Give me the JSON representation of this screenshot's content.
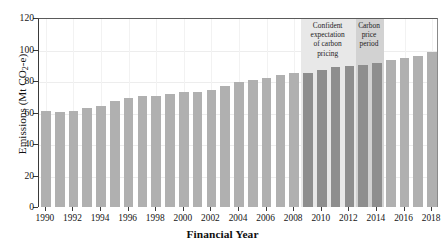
{
  "figure": {
    "ghost_text": "",
    "background_color": "#ffffff"
  },
  "axes": {
    "y_title_main": "Emissions (Mt CO",
    "y_title_sub": "2",
    "y_title_tail": "-e)",
    "x_title": "Financial Year",
    "y_ticks": [
      "0",
      "20",
      "40",
      "60",
      "80",
      "100",
      "120"
    ],
    "x_ticks": [
      "1990",
      "1992",
      "1994",
      "1996",
      "1998",
      "2000",
      "2002",
      "2004",
      "2006",
      "2008",
      "2010",
      "2012",
      "2014",
      "2016",
      "2018"
    ]
  },
  "annotations": {
    "confident": {
      "label": "Confident expectation of carbon pricing",
      "line1": "Confident",
      "line2": "expectation",
      "line3": "of carbon",
      "line4": "pricing",
      "start_year": 2009,
      "end_year": 2013,
      "fill": "#e8e8e8"
    },
    "carbon_price": {
      "label": "Carbon price period",
      "line1": "Carbon",
      "line2": "price",
      "line3": "period",
      "start_year": 2013,
      "end_year": 2015,
      "fill": "#d2d2d2"
    }
  },
  "colors": {
    "bar_normal": "#b0b0b0",
    "bar_highlight": "#8e8e8e",
    "axis": "#3a3a3a",
    "grid": "#ededed"
  },
  "chart_data": {
    "type": "bar",
    "title": "",
    "subtitle": "",
    "xlabel": "Financial Year",
    "ylabel": "Emissions (Mt CO2-e)",
    "ylim": [
      0,
      120
    ],
    "yticks": [
      0,
      20,
      40,
      60,
      80,
      100,
      120
    ],
    "grid": true,
    "legend": "none",
    "categories": [
      1990,
      1991,
      1992,
      1993,
      1994,
      1995,
      1996,
      1997,
      1998,
      1999,
      2000,
      2001,
      2002,
      2003,
      2004,
      2005,
      2006,
      2007,
      2008,
      2009,
      2010,
      2011,
      2012,
      2013,
      2014,
      2015,
      2016,
      2017,
      2018
    ],
    "values": [
      61.0,
      60.4,
      61.2,
      62.8,
      64.3,
      67.2,
      69.4,
      70.7,
      70.6,
      71.5,
      73.0,
      72.8,
      74.3,
      76.8,
      79.4,
      80.5,
      82.0,
      83.8,
      84.8,
      85.4,
      86.7,
      89.0,
      89.8,
      90.1,
      91.2,
      93.2,
      94.3,
      95.7,
      98.4
    ],
    "highlight_indices": [
      19,
      20,
      21,
      22,
      23,
      24
    ],
    "annotations": [
      {
        "text": "Confident expectation of carbon pricing",
        "x_start": 2009,
        "x_end": 2013
      },
      {
        "text": "Carbon price period",
        "x_start": 2013,
        "x_end": 2015
      }
    ]
  }
}
